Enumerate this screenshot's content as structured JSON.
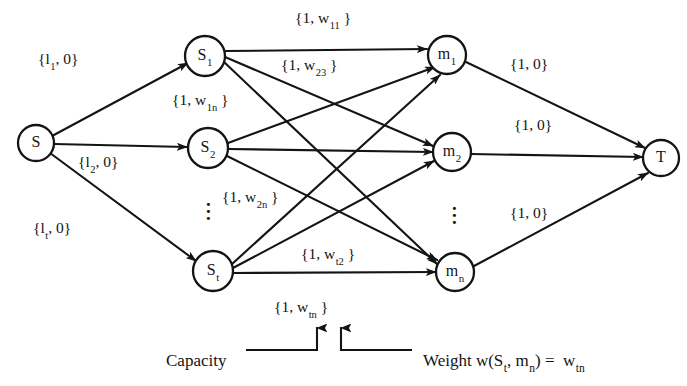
{
  "figure": {
    "type": "network-flow-diagram",
    "title": "",
    "background_color": "#ffffff",
    "stroke_color": "#141414"
  },
  "nodes": [
    {
      "id": "S",
      "label": "S",
      "sub": "",
      "cx": 36,
      "cy": 143,
      "r": 18
    },
    {
      "id": "S1",
      "label": "S",
      "sub": "1",
      "cx": 205,
      "cy": 56,
      "r": 20
    },
    {
      "id": "S2",
      "label": "S",
      "sub": "2",
      "cx": 208,
      "cy": 148,
      "r": 20
    },
    {
      "id": "St",
      "label": "S",
      "sub": "t",
      "cx": 213,
      "cy": 271,
      "r": 20
    },
    {
      "id": "m1",
      "label": "m",
      "sub": "1",
      "cx": 447,
      "cy": 55,
      "r": 19
    },
    {
      "id": "m2",
      "label": "m",
      "sub": "2",
      "cx": 452,
      "cy": 152,
      "r": 19
    },
    {
      "id": "mn",
      "label": "m",
      "sub": "n",
      "cx": 455,
      "cy": 272,
      "r": 19
    },
    {
      "id": "T",
      "label": "T",
      "sub": "",
      "cx": 661,
      "cy": 158,
      "r": 18
    }
  ],
  "ellipses": [
    {
      "id": "source-ellipsis",
      "x": 206,
      "y": 196
    },
    {
      "id": "target-ellipsis",
      "x": 452,
      "y": 200
    }
  ],
  "edges": [
    {
      "id": "S-S1",
      "from": "S",
      "to": "S1",
      "x1": 52,
      "y1": 136,
      "x2": 188,
      "y2": 63
    },
    {
      "id": "S-S2",
      "from": "S",
      "to": "S2",
      "x1": 54,
      "y1": 144,
      "x2": 187,
      "y2": 147
    },
    {
      "id": "S-St",
      "from": "S",
      "to": "St",
      "x1": 50,
      "y1": 153,
      "x2": 196,
      "y2": 261
    },
    {
      "id": "S1-m1",
      "from": "S1",
      "to": "m1",
      "x1": 225,
      "y1": 51,
      "x2": 427,
      "y2": 49
    },
    {
      "id": "S1-m2",
      "from": "S1",
      "to": "m2",
      "x1": 225,
      "y1": 57,
      "x2": 433,
      "y2": 146
    },
    {
      "id": "S1-mn",
      "from": "S1",
      "to": "mn",
      "x1": 224,
      "y1": 62,
      "x2": 437,
      "y2": 264
    },
    {
      "id": "S2-m1",
      "from": "S2",
      "to": "m1",
      "x1": 228,
      "y1": 143,
      "x2": 435,
      "y2": 67
    },
    {
      "id": "S2-m2",
      "from": "S2",
      "to": "m2",
      "x1": 228,
      "y1": 149,
      "x2": 433,
      "y2": 152
    },
    {
      "id": "S2-mn",
      "from": "S2",
      "to": "mn",
      "x1": 227,
      "y1": 156,
      "x2": 437,
      "y2": 260
    },
    {
      "id": "St-m1",
      "from": "St",
      "to": "m1",
      "x1": 232,
      "y1": 264,
      "x2": 440,
      "y2": 75
    },
    {
      "id": "St-m2",
      "from": "St",
      "to": "m2",
      "x1": 233,
      "y1": 268,
      "x2": 434,
      "y2": 161
    },
    {
      "id": "St-mn",
      "from": "St",
      "to": "mn",
      "x1": 233,
      "y1": 273,
      "x2": 436,
      "y2": 272
    },
    {
      "id": "m1-T",
      "from": "m1",
      "to": "T",
      "x1": 466,
      "y1": 62,
      "x2": 645,
      "y2": 148
    },
    {
      "id": "m2-T",
      "from": "m2",
      "to": "T",
      "x1": 471,
      "y1": 154,
      "x2": 643,
      "y2": 157
    },
    {
      "id": "mn-T",
      "from": "mn",
      "to": "T",
      "x1": 474,
      "y1": 266,
      "x2": 648,
      "y2": 173
    }
  ],
  "edge_labels": [
    {
      "id": "label-S-S1",
      "pre": "{l",
      "sub": "1",
      "post": ", 0}",
      "x": 38,
      "y": 51,
      "edge": "S-S1"
    },
    {
      "id": "label-S-S2",
      "pre": "{l",
      "sub": "2",
      "post": ", 0}",
      "x": 78,
      "y": 154,
      "edge": "S-S2"
    },
    {
      "id": "label-S-St",
      "pre": "{l",
      "sub": "t",
      "post": ", 0}",
      "x": 33,
      "y": 220,
      "edge": "S-St"
    },
    {
      "id": "label-S1-m1",
      "pre": "{1, w",
      "sub": "11",
      "post": " }",
      "x": 295,
      "y": 10,
      "edge": "S1-m1"
    },
    {
      "id": "label-S2-m1",
      "pre": "{1, w",
      "sub": "23",
      "post": " }",
      "x": 281,
      "y": 57,
      "edge": "S2-m1"
    },
    {
      "id": "label-S1-mn",
      "pre": "{1, w",
      "sub": "1n",
      "post": " }",
      "x": 172,
      "y": 92,
      "edge": "S1-mn"
    },
    {
      "id": "label-S2-mn",
      "pre": "{1, w",
      "sub": "2n",
      "post": " }",
      "x": 222,
      "y": 189,
      "edge": "S2-mn"
    },
    {
      "id": "label-St-m2",
      "pre": "{1, w",
      "sub": "t2",
      "post": " }",
      "x": 301,
      "y": 246,
      "edge": "St-m2"
    },
    {
      "id": "label-St-mn",
      "pre": "{1, w",
      "sub": "tn",
      "post": " }",
      "x": 274,
      "y": 299,
      "edge": "St-mn"
    },
    {
      "id": "label-m1-T",
      "pre": "{1, 0}",
      "sub": "",
      "post": "",
      "x": 510,
      "y": 56,
      "edge": "m1-T"
    },
    {
      "id": "label-m2-T",
      "pre": "{1, 0}",
      "sub": "",
      "post": "",
      "x": 514,
      "y": 117,
      "edge": "m2-T"
    },
    {
      "id": "label-mn-T",
      "pre": "{1, 0}",
      "sub": "",
      "post": "",
      "x": 510,
      "y": 205,
      "edge": "mn-T"
    }
  ],
  "legend": {
    "capacity_label": "Capacity",
    "capacity_x": 166,
    "capacity_y": 352,
    "weight": {
      "pre": "Weight w(S",
      "sub1": "t",
      "mid": ", m",
      "sub2": "n",
      "post": ") =",
      "result_pre": "w",
      "result_sub": "tn",
      "x": 423,
      "y": 352
    },
    "pointer_target": "label-St-mn",
    "arrow_capacity_x": 317,
    "arrow_weight_x": 341,
    "arrow_top_y": 324,
    "bar_y": 350
  }
}
